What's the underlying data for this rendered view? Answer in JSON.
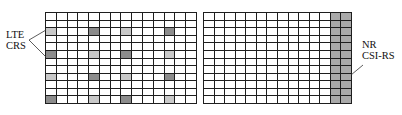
{
  "diagram": {
    "left_grid": {
      "name": "LTE resource grid",
      "columns": 14,
      "rows": 12,
      "shaded_rows": [
        2,
        5,
        8,
        11
      ],
      "shaded_columns": [
        0,
        4,
        7,
        11
      ],
      "pattern": [
        {
          "row": 2,
          "cols": {
            "0": "light",
            "4": "dark",
            "7": "light",
            "11": "dark"
          }
        },
        {
          "row": 5,
          "cols": {
            "0": "dark",
            "4": "light",
            "7": "dark",
            "11": "light"
          }
        },
        {
          "row": 8,
          "cols": {
            "0": "light",
            "4": "dark",
            "7": "light",
            "11": "dark"
          }
        },
        {
          "row": 11,
          "cols": {
            "0": "dark",
            "4": "light",
            "7": "dark",
            "11": "light"
          }
        }
      ]
    },
    "right_grid": {
      "name": "NR resource grid",
      "columns": 14,
      "rows": 12,
      "csi_rs_columns": [
        12,
        13
      ]
    },
    "labels": {
      "lte_crs_line1": "LTE",
      "lte_crs_line2": "CRS",
      "nr_csi_rs_line1": "NR",
      "nr_csi_rs_line2": "CSI-RS"
    },
    "colors": {
      "grid_line": "#1e1e1e",
      "crs_light": "#c9c9c9",
      "crs_dark": "#8c8c8c",
      "csi_rs": "#a9a9a9"
    }
  }
}
